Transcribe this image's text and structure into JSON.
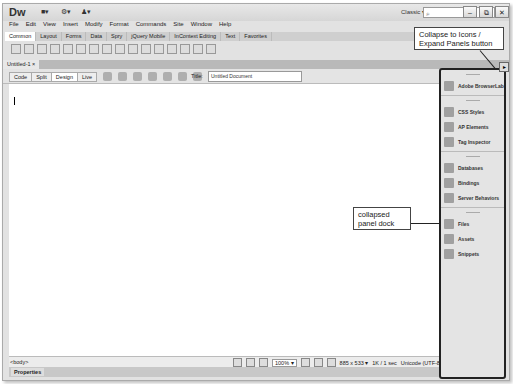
{
  "app": {
    "logo": "Dw",
    "workspace": "Classic",
    "search_placeholder": "⌕"
  },
  "titlebar_icons": [
    "layout-icon",
    "gear-icon",
    "user-icon"
  ],
  "window_buttons": {
    "minimize": "–",
    "restore": "⧉",
    "close": "✕"
  },
  "menu": [
    "File",
    "Edit",
    "View",
    "Insert",
    "Modify",
    "Format",
    "Commands",
    "Site",
    "Window",
    "Help"
  ],
  "insert_tabs": [
    "Common",
    "Layout",
    "Forms",
    "Data",
    "Spry",
    "jQuery Mobile",
    "InContext Editing",
    "Text",
    "Favorites"
  ],
  "insert_tabs_active": 0,
  "document_tab": {
    "label": "Untitled-1",
    "close": "×"
  },
  "view_buttons": [
    "Code",
    "Split",
    "Design",
    "Live"
  ],
  "view_active": 2,
  "doc_title": {
    "label": "Title:",
    "value": "Untitled Document"
  },
  "status": {
    "tag_selector": "<body>",
    "zoom": "100%",
    "window_size": "885 x 533",
    "download": "1K / 1 sec",
    "encoding": "Unicode (UTF-8)"
  },
  "properties_label": "Properties",
  "dock": {
    "groups": [
      [
        {
          "label": "Adobe BrowserLab",
          "icon": "browserlab-icon"
        }
      ],
      [
        {
          "label": "CSS Styles",
          "icon": "css-styles-icon"
        },
        {
          "label": "AP Elements",
          "icon": "ap-elements-icon"
        },
        {
          "label": "Tag Inspector",
          "icon": "tag-inspector-icon"
        }
      ],
      [
        {
          "label": "Databases",
          "icon": "databases-icon"
        },
        {
          "label": "Bindings",
          "icon": "bindings-icon"
        },
        {
          "label": "Server Behaviors",
          "icon": "server-behaviors-icon"
        }
      ],
      [
        {
          "label": "Files",
          "icon": "files-icon"
        },
        {
          "label": "Assets",
          "icon": "assets-icon"
        },
        {
          "label": "Snippets",
          "icon": "snippets-icon"
        }
      ]
    ]
  },
  "callouts": {
    "collapse": "Collapse to Icons / Expand Panels button",
    "dock": "collapsed panel dock"
  }
}
